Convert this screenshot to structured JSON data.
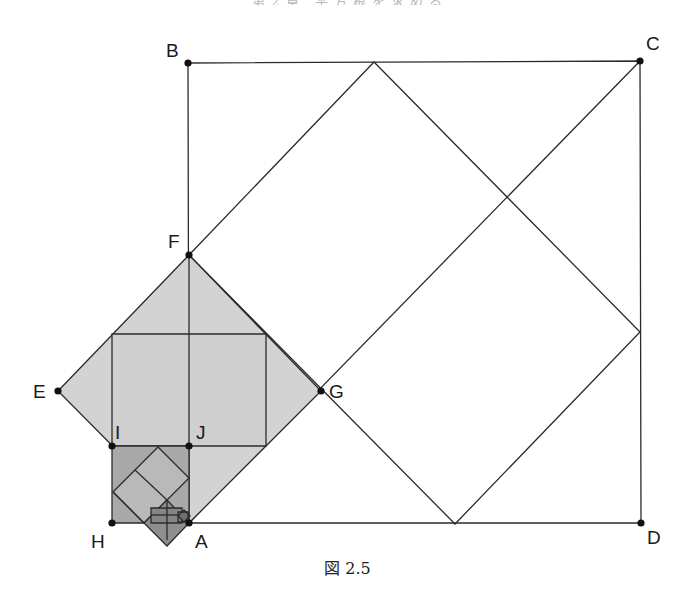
{
  "header": {
    "text": "第2章 平方根を求める"
  },
  "figure": {
    "caption": "図 2.5",
    "colors": {
      "line": "#2b2b2b",
      "fill_light": "#d3d3d3",
      "fill_mid": "#b4b4b4",
      "fill_dark": "#8e8e8e",
      "fill_darker": "#6f6f6f",
      "point": "#111111"
    },
    "points": [
      {
        "name": "A",
        "x": 189,
        "y": 523
      },
      {
        "name": "B",
        "x": 188,
        "y": 63
      },
      {
        "name": "C",
        "x": 640,
        "y": 61
      },
      {
        "name": "D",
        "x": 641,
        "y": 523
      },
      {
        "name": "E",
        "x": 58,
        "y": 391
      },
      {
        "name": "F",
        "x": 189,
        "y": 255
      },
      {
        "name": "G",
        "x": 321,
        "y": 391
      },
      {
        "name": "H",
        "x": 112,
        "y": 523
      },
      {
        "name": "I",
        "x": 112,
        "y": 446
      },
      {
        "name": "J",
        "x": 189,
        "y": 446
      }
    ],
    "labels": {
      "A": "A",
      "B": "B",
      "C": "C",
      "D": "D",
      "E": "E",
      "F": "F",
      "G": "G",
      "H": "H",
      "I": "I",
      "J": "J"
    }
  }
}
